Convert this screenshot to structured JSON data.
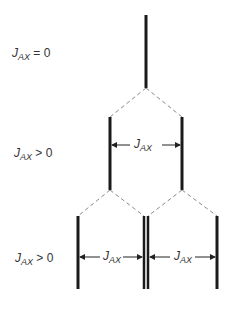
{
  "diagram": {
    "rows": [
      {
        "symbol": "J",
        "subscript": "AX",
        "relation": "= 0"
      },
      {
        "symbol": "J",
        "subscript": "AX",
        "relation": "> 0"
      },
      {
        "symbol": "J",
        "subscript": "AX",
        "relation": "> 0"
      }
    ],
    "dimensions": [
      {
        "symbol": "J",
        "subscript": "AX"
      },
      {
        "symbol": "J",
        "subscript": "AX"
      },
      {
        "symbol": "J",
        "subscript": "AX"
      }
    ],
    "colors": {
      "line": "#1a1a1a",
      "dash": "#888888",
      "text": "#333333"
    }
  }
}
